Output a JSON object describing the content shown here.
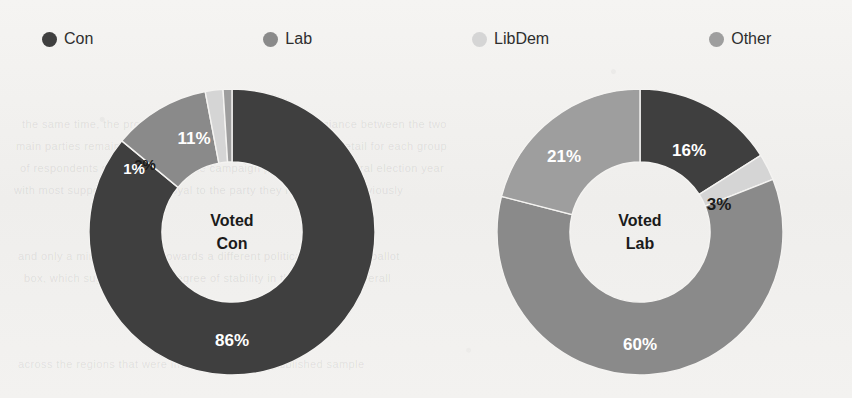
{
  "background_color": "#f2f1ef",
  "ghost_lines": [
    {
      "text": "the same time, the proportion of voters who switched allegiance between the two",
      "top": 118
    },
    {
      "text": "main parties remained small, as the chart below illustrates in detail for each group",
      "top": 140
    },
    {
      "text": "of respondents surveyed during the campaign period of the general election year",
      "top": 162
    },
    {
      "text": "with most supporters staying loyal to the party they had backed previously",
      "top": 184
    },
    {
      "text": "and only a minority moving towards a different political party at the ballot",
      "top": 250
    },
    {
      "text": "box, which suggests a high degree of stability in the electorate overall",
      "top": 272
    },
    {
      "text": "across the regions that were included within the published sample",
      "top": 358
    }
  ],
  "legend": {
    "items": [
      {
        "label": "Con",
        "color": "#3f3f3f",
        "icon": "legend-dot-icon"
      },
      {
        "label": "Lab",
        "color": "#8a8a8a",
        "icon": "legend-dot-icon"
      },
      {
        "label": "LibDem",
        "color": "#d5d5d5",
        "icon": "legend-dot-icon"
      },
      {
        "label": "Other",
        "color": "#9e9e9e",
        "icon": "legend-dot-icon"
      }
    ]
  },
  "charts": [
    {
      "id": "voted-con",
      "center_line1": "Voted",
      "center_line2": "Con",
      "labels": {
        "con": "86%",
        "lab": "11%",
        "libdem": "2%",
        "other": "1%"
      }
    },
    {
      "id": "voted-lab",
      "center_line1": "Voted",
      "center_line2": "Lab",
      "labels": {
        "con": "16%",
        "libdem": "3%",
        "lab": "60%",
        "other": "21%"
      }
    }
  ],
  "chart_data": [
    {
      "type": "pie",
      "title": "Voted Con",
      "subtitle": "",
      "xlabel": "",
      "ylabel": "",
      "donut": true,
      "hole_fraction": 0.49,
      "start_angle_deg": 0,
      "direction": "clockwise",
      "legend_position": "top",
      "grid": false,
      "categories": [
        "Con",
        "Lab",
        "LibDem",
        "Other"
      ],
      "values": [
        86,
        11,
        2,
        1
      ],
      "value_labels": [
        "86%",
        "11%",
        "2%",
        "1%"
      ],
      "colors": [
        "#3f3f3f",
        "#8a8a8a",
        "#d5d5d5",
        "#9e9e9e"
      ],
      "units": "percent",
      "total": 100
    },
    {
      "type": "pie",
      "title": "Voted Lab",
      "subtitle": "",
      "xlabel": "",
      "ylabel": "",
      "donut": true,
      "hole_fraction": 0.49,
      "start_angle_deg": 0,
      "direction": "clockwise",
      "legend_position": "top",
      "grid": false,
      "categories": [
        "Con",
        "LibDem",
        "Lab",
        "Other"
      ],
      "values": [
        16,
        3,
        60,
        21
      ],
      "value_labels": [
        "16%",
        "3%",
        "60%",
        "21%"
      ],
      "colors": [
        "#3f3f3f",
        "#d5d5d5",
        "#8a8a8a",
        "#9e9e9e"
      ],
      "units": "percent",
      "total": 100
    }
  ]
}
